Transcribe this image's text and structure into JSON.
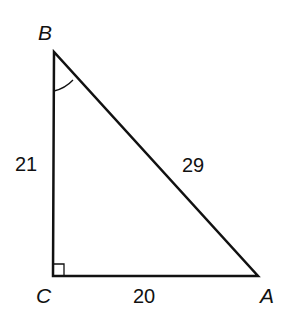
{
  "figure": {
    "type": "right triangle",
    "vertices": {
      "B": {
        "label": "B"
      },
      "C": {
        "label": "C"
      },
      "A": {
        "label": "A"
      }
    },
    "sides": {
      "BC": {
        "label": "21"
      },
      "BA": {
        "label": "29"
      },
      "CA": {
        "label": "20"
      }
    },
    "marks": {
      "right_angle_at": "C",
      "angle_arc_at": "B"
    },
    "colors": {
      "stroke": "#111111",
      "background": "#ffffff"
    }
  }
}
